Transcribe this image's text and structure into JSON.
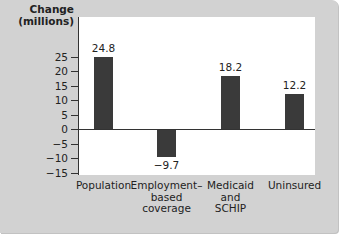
{
  "chart_data": {
    "type": "bar",
    "title": "",
    "xlabel": "",
    "ylabel": "Change (millions)",
    "ylabel_lines": [
      "Change",
      "(millions)"
    ],
    "categories": [
      "Population",
      "Employment-based coverage",
      "Medicaid and SCHIP",
      "Uninsured"
    ],
    "category_label_lines": [
      "Population",
      "Employment–\nbased\ncoverage",
      "Medicaid\nand\nSCHIP",
      "Uninsured"
    ],
    "values": [
      24.8,
      -9.7,
      18.2,
      12.2
    ],
    "value_labels": [
      "24.8",
      "−9.7",
      "18.2",
      "12.2"
    ],
    "ylim": [
      -15,
      25
    ],
    "yticks": [
      25,
      20,
      15,
      10,
      5,
      0,
      -5,
      -10,
      -15
    ],
    "ytick_labels": [
      "25",
      "20",
      "15",
      "10",
      "5",
      "0",
      "−5",
      "−10",
      "−15"
    ],
    "grid": false,
    "legend": null,
    "bar_color": "#3a3a3a",
    "panel_color": "#d2d2d2",
    "plot_bg": "#ffffff"
  }
}
